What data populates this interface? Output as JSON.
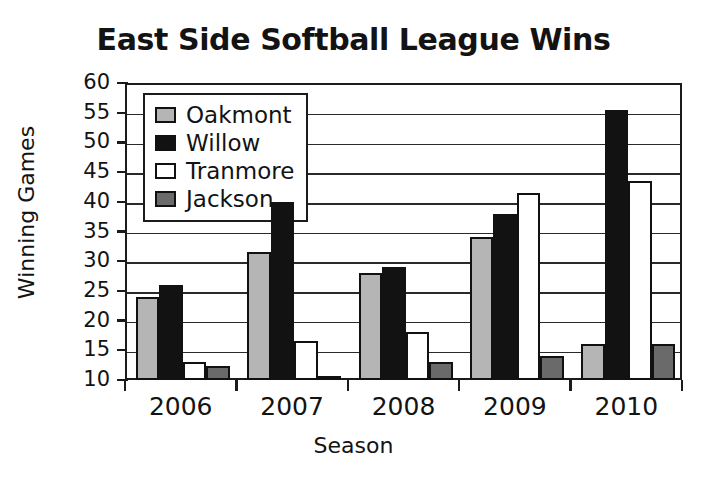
{
  "chart_data": {
    "type": "bar",
    "title": "East Side Softball League Wins",
    "xlabel": "Season",
    "ylabel": "Winning Games",
    "categories": [
      "2006",
      "2007",
      "2008",
      "2009",
      "2010"
    ],
    "ylim": [
      10,
      60
    ],
    "yticks": [
      60,
      55,
      50,
      45,
      40,
      35,
      30,
      25,
      20,
      15,
      10
    ],
    "grid": true,
    "legend_position": "top-left-inside",
    "series": [
      {
        "name": "Oakmont",
        "color": "#b5b5b5",
        "values": [
          24,
          31.5,
          28,
          34,
          16
        ]
      },
      {
        "name": "Willow",
        "color": "#121212",
        "values": [
          26,
          40,
          29,
          38,
          55.5
        ]
      },
      {
        "name": "Tranmore",
        "color": "#ffffff",
        "values": [
          13,
          16.5,
          18,
          41.5,
          43.5
        ]
      },
      {
        "name": "Jackson",
        "color": "#6a6a6a",
        "values": [
          12.3,
          10.5,
          13,
          14,
          16
        ]
      }
    ]
  }
}
